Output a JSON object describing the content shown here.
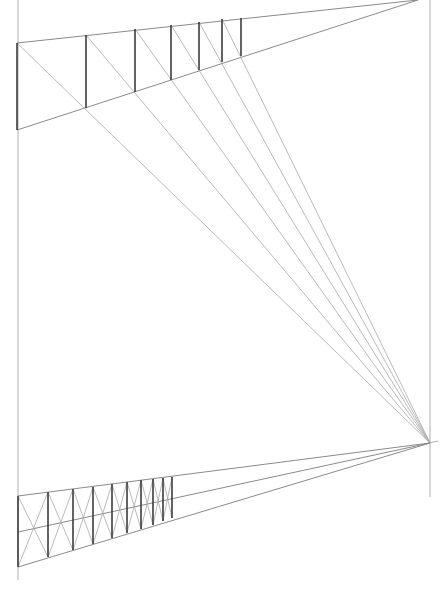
{
  "title": "",
  "diagram": {
    "type": "perspective-construction-sketch",
    "colors": {
      "background": "#ffffff",
      "guide": "#9a9a9a",
      "post": "#3c3c3c",
      "diagonal": "#a8a8a8"
    },
    "frame": {
      "left_rule": {
        "x": 18,
        "y1": 0,
        "y2": 580
      },
      "right_rule": {
        "x": 430,
        "y1": 0,
        "y2": 497
      }
    },
    "vanishing_points": {
      "top": {
        "x": 418,
        "y": 0
      },
      "right": {
        "x": 430,
        "y": 443
      }
    },
    "top_fence": {
      "top_line": {
        "x1": 17,
        "y1": 43,
        "x2": 418,
        "y2": 0
      },
      "bottom_line": {
        "x1": 17,
        "y1": 130,
        "x2": 418,
        "y2": 0
      },
      "posts": [
        {
          "x": 17,
          "top": 43,
          "bottom": 130
        },
        {
          "x": 86,
          "top": 35,
          "bottom": 108
        },
        {
          "x": 135,
          "top": 29,
          "bottom": 92
        },
        {
          "x": 171,
          "top": 25,
          "bottom": 80
        },
        {
          "x": 199,
          "top": 22,
          "bottom": 70
        },
        {
          "x": 222,
          "top": 19,
          "bottom": 62
        },
        {
          "x": 241,
          "top": 18,
          "bottom": 56
        }
      ],
      "rays_to_vp": [
        {
          "x": 17,
          "y": 43
        },
        {
          "x": 86,
          "y": 35
        },
        {
          "x": 135,
          "y": 29
        },
        {
          "x": 171,
          "y": 25
        },
        {
          "x": 199,
          "y": 22
        },
        {
          "x": 222,
          "y": 19
        }
      ]
    },
    "bottom_fence": {
      "top_line": {
        "x1": 18,
        "y1": 496,
        "x2": 430,
        "y2": 443
      },
      "middle_line": {
        "x1": 18,
        "y1": 532,
        "x2": 430,
        "y2": 443
      },
      "bottom_line": {
        "x1": 18,
        "y1": 567,
        "x2": 430,
        "y2": 443
      },
      "posts": [
        {
          "x": 18,
          "top": 496,
          "bottom": 567
        },
        {
          "x": 48,
          "top": 492,
          "bottom": 557
        },
        {
          "x": 73,
          "top": 489,
          "bottom": 550
        },
        {
          "x": 93,
          "top": 487,
          "bottom": 544
        },
        {
          "x": 112,
          "top": 484,
          "bottom": 538
        },
        {
          "x": 127,
          "top": 482,
          "bottom": 533
        },
        {
          "x": 141,
          "top": 480,
          "bottom": 529
        },
        {
          "x": 153,
          "top": 479,
          "bottom": 525
        },
        {
          "x": 163,
          "top": 478,
          "bottom": 521
        },
        {
          "x": 172,
          "top": 477,
          "bottom": 518
        }
      ]
    }
  }
}
